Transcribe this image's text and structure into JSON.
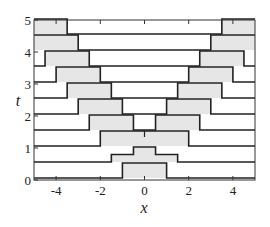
{
  "chart_data": {
    "type": "line",
    "title": "",
    "xlabel": "x",
    "ylabel": "t",
    "xlim": [
      -5,
      5
    ],
    "ylim": [
      0,
      5
    ],
    "xticks": [
      -4,
      -2,
      0,
      2,
      4
    ],
    "yticks": [
      0,
      1,
      2,
      3,
      4,
      5
    ],
    "xtick_labels": [
      "-4",
      "-2",
      "0",
      "2",
      "4"
    ],
    "ytick_labels": [
      "0",
      "1",
      "2",
      "3",
      "4",
      "5"
    ],
    "grid": false,
    "legend": null,
    "pulse_height": 0.25,
    "fill_color": "#e6e6e6",
    "line_color": "#222222",
    "series": [
      {
        "t": 0.0,
        "segments": [
          [
            -5,
            0
          ],
          [
            -1,
            0
          ],
          [
            -1,
            1
          ],
          [
            1,
            1
          ],
          [
            1,
            0
          ],
          [
            5,
            0
          ]
        ]
      },
      {
        "t": 0.5,
        "segments": [
          [
            -5,
            0
          ],
          [
            -1.5,
            0
          ],
          [
            -1.5,
            0.5
          ],
          [
            -0.5,
            0.5
          ],
          [
            -0.5,
            1
          ],
          [
            0.5,
            1
          ],
          [
            0.5,
            0.5
          ],
          [
            1.5,
            0.5
          ],
          [
            1.5,
            0
          ],
          [
            5,
            0
          ]
        ]
      },
      {
        "t": 1.0,
        "segments": [
          [
            -5,
            0
          ],
          [
            -2,
            0
          ],
          [
            -2,
            1
          ],
          [
            2,
            1
          ],
          [
            2,
            0
          ],
          [
            5,
            0
          ]
        ],
        "center_mark": 0
      },
      {
        "t": 1.5,
        "segments": [
          [
            -5,
            0
          ],
          [
            -2.5,
            0
          ],
          [
            -2.5,
            1
          ],
          [
            -0.5,
            1
          ],
          [
            -0.5,
            0
          ],
          [
            0.5,
            0
          ],
          [
            0.5,
            1
          ],
          [
            2.5,
            1
          ],
          [
            2.5,
            0
          ],
          [
            5,
            0
          ]
        ]
      },
      {
        "t": 2.0,
        "segments": [
          [
            -5,
            0
          ],
          [
            -3,
            0
          ],
          [
            -3,
            1
          ],
          [
            -1,
            1
          ],
          [
            -1,
            0
          ],
          [
            1,
            0
          ],
          [
            1,
            1
          ],
          [
            3,
            1
          ],
          [
            3,
            0
          ],
          [
            5,
            0
          ]
        ]
      },
      {
        "t": 2.5,
        "segments": [
          [
            -5,
            0
          ],
          [
            -3.5,
            0
          ],
          [
            -3.5,
            1
          ],
          [
            -1.5,
            1
          ],
          [
            -1.5,
            0
          ],
          [
            1.5,
            0
          ],
          [
            1.5,
            1
          ],
          [
            3.5,
            1
          ],
          [
            3.5,
            0
          ],
          [
            5,
            0
          ]
        ]
      },
      {
        "t": 3.0,
        "segments": [
          [
            -5,
            0
          ],
          [
            -4,
            0
          ],
          [
            -4,
            1
          ],
          [
            -2,
            1
          ],
          [
            -2,
            0
          ],
          [
            2,
            0
          ],
          [
            2,
            1
          ],
          [
            4,
            1
          ],
          [
            4,
            0
          ],
          [
            5,
            0
          ]
        ]
      },
      {
        "t": 3.5,
        "segments": [
          [
            -5,
            0
          ],
          [
            -4.5,
            0
          ],
          [
            -4.5,
            1
          ],
          [
            -2.5,
            1
          ],
          [
            -2.5,
            0
          ],
          [
            2.5,
            0
          ],
          [
            2.5,
            1
          ],
          [
            4.5,
            1
          ],
          [
            4.5,
            0
          ],
          [
            5,
            0
          ]
        ]
      },
      {
        "t": 4.0,
        "segments": [
          [
            -5,
            1
          ],
          [
            -3,
            1
          ],
          [
            -3,
            0
          ],
          [
            3,
            0
          ],
          [
            3,
            1
          ],
          [
            5,
            1
          ]
        ]
      },
      {
        "t": 4.5,
        "segments": [
          [
            -5,
            1
          ],
          [
            -3.5,
            1
          ],
          [
            -3.5,
            0
          ],
          [
            3.5,
            0
          ],
          [
            3.5,
            1
          ],
          [
            5,
            1
          ]
        ]
      }
    ]
  }
}
